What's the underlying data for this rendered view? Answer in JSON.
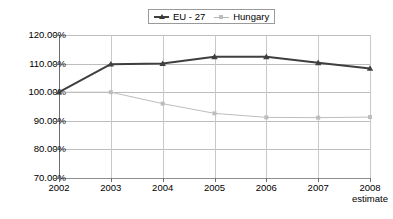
{
  "chart_data": {
    "type": "line",
    "title": "",
    "subtitle": "",
    "xlabel": "",
    "ylabel": "",
    "x": [
      "2002",
      "2003",
      "2004",
      "2005",
      "2006",
      "2007",
      "2008"
    ],
    "categories": [
      "2002",
      "2003",
      "2004",
      "2005",
      "2006",
      "2007",
      "2008"
    ],
    "x_tick_sublabels": [
      "",
      "",
      "",
      "",
      "",
      "",
      "estimate"
    ],
    "series": [
      {
        "name": "EU - 27",
        "color": "#3f3f3f",
        "marker": "triangle",
        "line_width": 2,
        "values": [
          100.0,
          109.8,
          110.0,
          112.4,
          112.4,
          110.3,
          108.3
        ]
      },
      {
        "name": "Hungary",
        "color": "#bdbdbd",
        "marker": "square",
        "line_width": 1,
        "values": [
          100.0,
          100.0,
          96.0,
          92.6,
          91.2,
          91.1,
          91.3
        ]
      }
    ],
    "ylim": [
      70,
      120
    ],
    "y_ticks": [
      70,
      80,
      90,
      100,
      110,
      120
    ],
    "y_tick_labels": [
      "70.00%",
      "80.00%",
      "90.00%",
      "100.00%",
      "110.00%",
      "120.00%"
    ],
    "y_tick_format": "percent",
    "grid": true,
    "grid_axis": "y",
    "legend": {
      "position": "top-center",
      "boxed": true,
      "orientation": "horizontal",
      "entries": [
        "EU - 27",
        "Hungary"
      ]
    },
    "background_color": "#ffffff",
    "gridline_color": "#bdbdbd",
    "axis_color": "#6e6e6e"
  },
  "legend": {
    "items": [
      {
        "label": "EU - 27"
      },
      {
        "label": "Hungary"
      }
    ]
  },
  "y_axis": {
    "labels": [
      "120.00%",
      "110.00%",
      "100.00%",
      "90.00%",
      "80.00%",
      "70.00%"
    ]
  },
  "x_axis": {
    "labels": [
      "2002",
      "2003",
      "2004",
      "2005",
      "2006",
      "2007",
      "2008"
    ],
    "sublabel_2008": "estimate"
  },
  "caption": {
    "text": ""
  }
}
